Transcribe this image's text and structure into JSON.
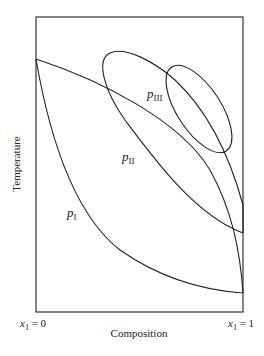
{
  "diagram": {
    "type": "phase-diagram",
    "ylabel": "Temperature",
    "xlabel": "Composition",
    "x_left_label": {
      "var": "x",
      "sub": "1",
      "rest": " = 0"
    },
    "x_right_label": {
      "var": "x",
      "sub": "1",
      "rest": " = 1"
    },
    "regions": [
      {
        "id": "pI",
        "var": "p",
        "sub": "I"
      },
      {
        "id": "pII",
        "var": "p",
        "sub": "II"
      },
      {
        "id": "pIII",
        "var": "p",
        "sub": "III"
      }
    ],
    "line_color": "#222222"
  }
}
